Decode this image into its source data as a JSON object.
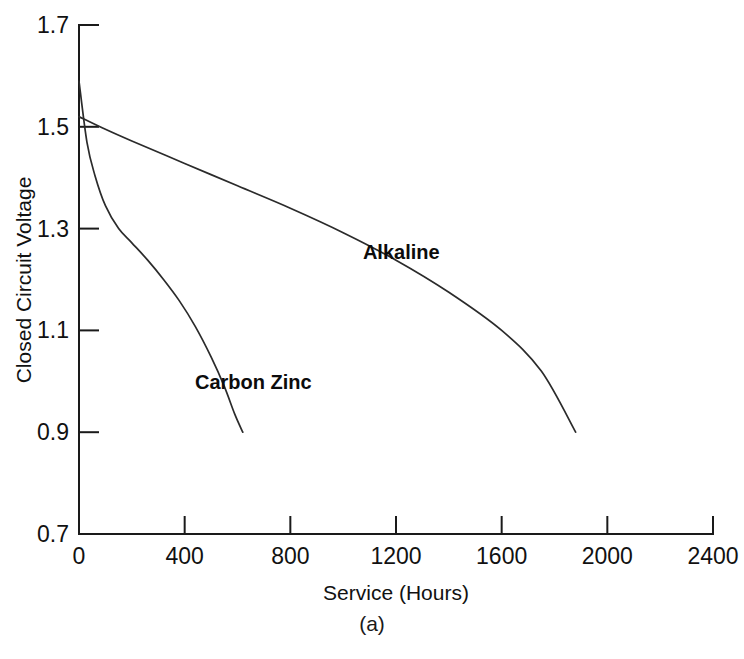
{
  "figure": {
    "caption": "(a)"
  },
  "chart_data": {
    "type": "line",
    "title": "",
    "xlabel": "Service (Hours)",
    "ylabel": "Closed Circuit Voltage",
    "xlim": [
      0,
      2400
    ],
    "ylim": [
      0.7,
      1.7
    ],
    "xticks": [
      0,
      400,
      800,
      1200,
      1600,
      2000,
      2400
    ],
    "xtick_labels": [
      "0",
      "400",
      "800",
      "1200",
      "1600",
      "2000",
      "2400"
    ],
    "yticks": [
      0.7,
      0.9,
      1.1,
      1.3,
      1.5,
      1.7
    ],
    "ytick_labels": [
      "0.7",
      "0.9",
      "1.1",
      "1.3",
      "1.5",
      "1.7"
    ],
    "grid": false,
    "legend_position": "inline-annotations",
    "series": [
      {
        "name": "Alkaline",
        "label_x": 1220,
        "label_y": 1.24,
        "x": [
          0,
          100,
          200,
          400,
          600,
          800,
          1000,
          1200,
          1400,
          1600,
          1750,
          1880
        ],
        "y": [
          1.52,
          1.495,
          1.472,
          1.428,
          1.384,
          1.34,
          1.292,
          1.238,
          1.175,
          1.1,
          1.02,
          0.9
        ]
      },
      {
        "name": "Carbon Zinc",
        "label_x": 660,
        "label_y": 0.985,
        "x": [
          0,
          30,
          60,
          100,
          150,
          200,
          260,
          320,
          380,
          440,
          500,
          550,
          590,
          620
        ],
        "y": [
          1.59,
          1.47,
          1.405,
          1.345,
          1.3,
          1.272,
          1.238,
          1.2,
          1.158,
          1.108,
          1.048,
          0.99,
          0.935,
          0.9
        ]
      }
    ]
  }
}
